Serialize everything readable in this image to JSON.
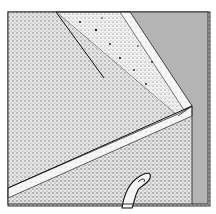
{
  "image": {
    "subject": "stippled illustration of an open drawer corner with a curved handle",
    "colors": {
      "background": "#ffffff",
      "gray_panel": "#b4b4b4",
      "interior_stipple": "#d2d2d2",
      "side_panel_stipple": "#e4e4e4",
      "front_panel_stipple": "#dcdcdc",
      "edge_stipple": "#f0f0f0",
      "outline": "#1e1e1e"
    }
  }
}
